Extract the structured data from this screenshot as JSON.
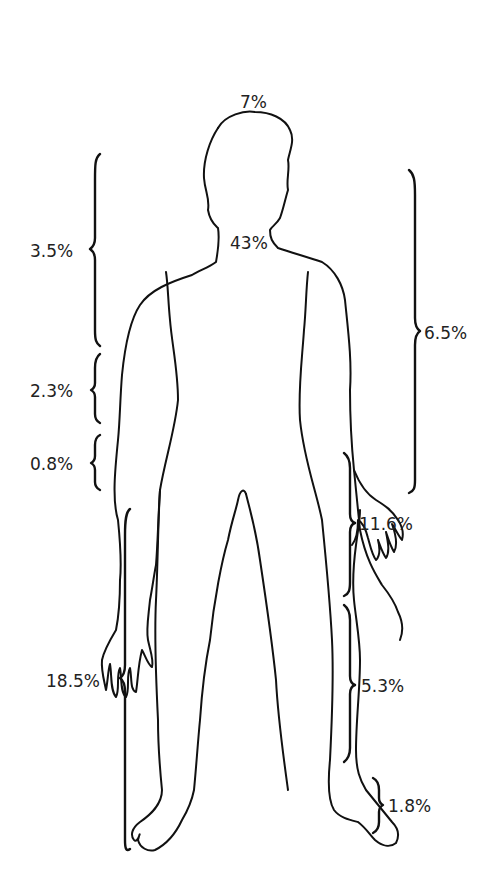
{
  "diagram": {
    "regions": [
      {
        "id": "head",
        "label": "7%"
      },
      {
        "id": "trunk",
        "label": "43%"
      },
      {
        "id": "upper-arm",
        "label": "3.5%"
      },
      {
        "id": "forearm",
        "label": "2.3%"
      },
      {
        "id": "hand",
        "label": "0.8%"
      },
      {
        "id": "entire-arm",
        "label": "6.5%"
      },
      {
        "id": "thigh",
        "label": "11.6%"
      },
      {
        "id": "lower-leg",
        "label": "5.3%"
      },
      {
        "id": "foot",
        "label": "1.8%"
      },
      {
        "id": "entire-leg",
        "label": "18.5%"
      }
    ],
    "colors": {
      "line": "#111111",
      "text": "#222222",
      "background": "#ffffff"
    }
  }
}
